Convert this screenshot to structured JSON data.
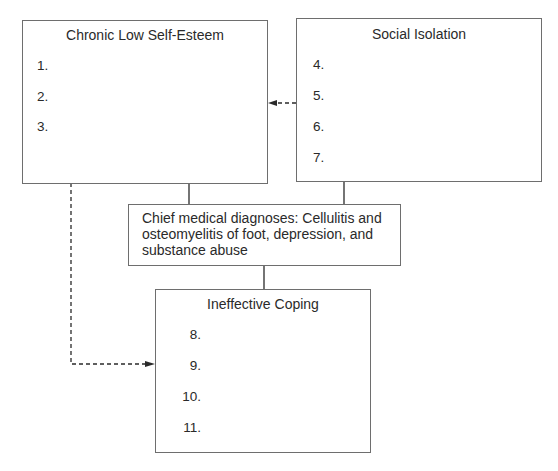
{
  "diagram": {
    "boxes": {
      "chronic_low_self_esteem": {
        "title": "Chronic Low Self-Esteem",
        "items": [
          "1.",
          "2.",
          "3."
        ]
      },
      "social_isolation": {
        "title": "Social Isolation",
        "items": [
          "4.",
          "5.",
          "6.",
          "7."
        ]
      },
      "chief_medical_diagnoses": {
        "text": "Chief medical diagnoses: Cellulitis and osteomyelitis of foot, depression, and substance abuse"
      },
      "ineffective_coping": {
        "title": "Ineffective Coping",
        "items": [
          "8.",
          "9.",
          "10.",
          "11."
        ]
      }
    },
    "connectors": [
      {
        "from": "chronic_low_self_esteem",
        "to": "chief_medical_diagnoses",
        "style": "solid"
      },
      {
        "from": "social_isolation",
        "to": "chief_medical_diagnoses",
        "style": "solid"
      },
      {
        "from": "chief_medical_diagnoses",
        "to": "ineffective_coping",
        "style": "solid"
      },
      {
        "from": "social_isolation",
        "to": "chronic_low_self_esteem",
        "style": "dashed-arrow"
      },
      {
        "from": "chronic_low_self_esteem",
        "to": "ineffective_coping",
        "style": "dashed-arrow"
      }
    ],
    "colors": {
      "border": "#6e6e6e",
      "line": "#2a2a2a",
      "text": "#2a2a2a"
    }
  }
}
